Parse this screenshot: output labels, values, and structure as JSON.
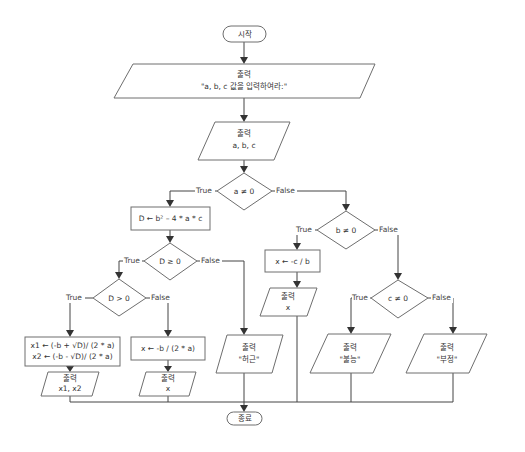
{
  "flowchart": {
    "start": {
      "label": "시작"
    },
    "end": {
      "label": "종료"
    },
    "prompt_output": {
      "line1": "출력",
      "line2": "\"a, b, c 값을 입력하여라:\""
    },
    "input_abc": {
      "line1": "출력",
      "line2": "a, b, c"
    },
    "decision_a": {
      "label": "a ≠ 0",
      "true_label": "True",
      "false_label": "False"
    },
    "compute_D": {
      "label": "D ← b² – 4 * a * c"
    },
    "decision_D_ge": {
      "label": "D ≥ 0",
      "true_label": "True",
      "false_label": "False"
    },
    "decision_D_gt": {
      "label": "D > 0",
      "true_label": "True",
      "false_label": "False"
    },
    "compute_two_roots": {
      "line1": "x1 ← (-b + √D)/ (2 * a)",
      "line2": "x2 ← (-b - √D)/ (2 * a)"
    },
    "output_two_roots": {
      "line1": "출력",
      "line2": "x1, x2"
    },
    "compute_one_root": {
      "label": "x ← -b / (2 * a)"
    },
    "output_one_root": {
      "line1": "출력",
      "line2": "x"
    },
    "output_imaginary": {
      "line1": "출력",
      "line2": "\"허근\""
    },
    "decision_b": {
      "label": "b ≠ 0",
      "true_label": "True",
      "false_label": "False"
    },
    "compute_linear": {
      "label": "x ← -c / b"
    },
    "output_linear": {
      "line1": "출력",
      "line2": "x"
    },
    "decision_c": {
      "label": "c ≠ 0",
      "true_label": "True",
      "false_label": "False"
    },
    "output_impossible": {
      "line1": "출력",
      "line2": "\"불능\""
    },
    "output_indeterminate": {
      "line1": "출력",
      "line2": "\"부정\""
    }
  }
}
